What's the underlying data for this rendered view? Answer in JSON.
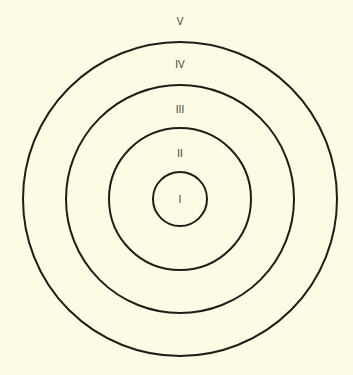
{
  "diagram": {
    "background": "#fdfbe4",
    "stroke": "#1f1d18",
    "center": {
      "x": 180,
      "y": 199
    },
    "zones": [
      {
        "label": "I",
        "radius": 27,
        "label_y": 203
      },
      {
        "label": "II",
        "radius": 71,
        "label_y": 157
      },
      {
        "label": "III",
        "radius": 114,
        "label_y": 113
      },
      {
        "label": "IV",
        "radius": 157,
        "label_y": 68
      },
      {
        "label": "V",
        "radius": null,
        "label_y": 25
      }
    ]
  }
}
